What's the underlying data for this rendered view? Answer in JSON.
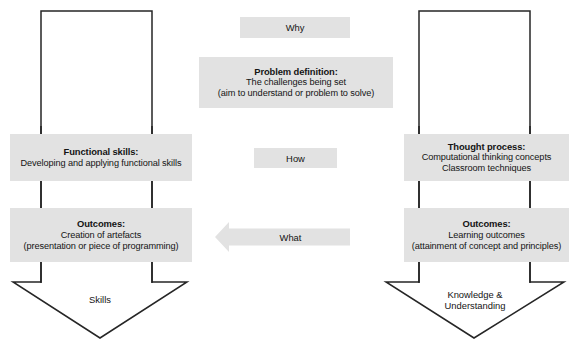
{
  "diagram": {
    "colors": {
      "box_fill": "#e2e2e2",
      "outline_stroke": "#262626",
      "connector_stroke": "#1f1f1f",
      "text": "#141414",
      "background": "#ffffff"
    },
    "center_column": {
      "why_label": "Why",
      "how_label": "How",
      "what_label": "What",
      "problem_definition": {
        "title": "Problem definition:",
        "lines": [
          "The challenges being set",
          "(aim to understand or problem to solve)"
        ]
      }
    },
    "left_column": {
      "functional_skills": {
        "title": "Functional skills:",
        "lines": [
          "Developing and applying functional skills"
        ]
      },
      "outcomes": {
        "title": "Outcomes:",
        "lines": [
          "Creation of artefacts",
          "(presentation or piece of programming)"
        ]
      },
      "arrow_label": "Skills"
    },
    "right_column": {
      "thought_process": {
        "title": "Thought process:",
        "lines": [
          "Computational thinking concepts",
          "Classroom techniques"
        ]
      },
      "outcomes": {
        "title": "Outcomes:",
        "lines": [
          "Learning outcomes",
          "(attainment of concept and principles)"
        ]
      },
      "arrow_label_line1": "Knowledge &",
      "arrow_label_line2": "Understanding"
    }
  }
}
